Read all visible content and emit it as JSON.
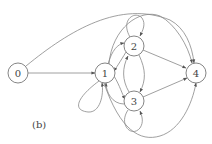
{
  "diagram": {
    "type": "directed-graph",
    "caption": "(b)",
    "nodes": [
      {
        "id": "0",
        "label": "0"
      },
      {
        "id": "1",
        "label": "1"
      },
      {
        "id": "2",
        "label": "2"
      },
      {
        "id": "3",
        "label": "3"
      },
      {
        "id": "4",
        "label": "4"
      }
    ],
    "edges": [
      {
        "from": "0",
        "to": "1"
      },
      {
        "from": "0",
        "to": "4"
      },
      {
        "from": "1",
        "to": "1"
      },
      {
        "from": "1",
        "to": "2"
      },
      {
        "from": "2",
        "to": "1"
      },
      {
        "from": "1",
        "to": "3"
      },
      {
        "from": "3",
        "to": "1"
      },
      {
        "from": "1",
        "to": "4"
      },
      {
        "from": "1",
        "to": "4"
      },
      {
        "from": "2",
        "to": "2"
      },
      {
        "from": "2",
        "to": "3"
      },
      {
        "from": "3",
        "to": "2"
      },
      {
        "from": "2",
        "to": "4"
      },
      {
        "from": "3",
        "to": "3"
      },
      {
        "from": "3",
        "to": "4"
      }
    ]
  }
}
